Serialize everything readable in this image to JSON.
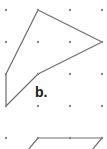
{
  "diagram": {
    "type": "dot-grid-polygons",
    "grid": {
      "columns_x": [
        6,
        38,
        70,
        102
      ],
      "rows_y": [
        10,
        42,
        74,
        106,
        138
      ],
      "spacing": 32,
      "dot_color": "#8a8a8a",
      "dot_radius": 1.2
    },
    "line_color": "#6e6e6e",
    "shapes": [
      {
        "id": "b",
        "label": "b.",
        "label_position": {
          "x": 35,
          "y": 85
        },
        "points": [
          [
            38,
            10
          ],
          [
            102,
            42
          ],
          [
            38,
            74
          ],
          [
            6,
            106
          ],
          [
            6,
            74
          ]
        ],
        "closed": true
      },
      {
        "id": "c-partial",
        "label": "",
        "points": [
          [
            28,
            150
          ],
          [
            38,
            138
          ],
          [
            70,
            138
          ],
          [
            102,
            138
          ],
          [
            92,
            150
          ]
        ],
        "closed": false
      }
    ]
  }
}
